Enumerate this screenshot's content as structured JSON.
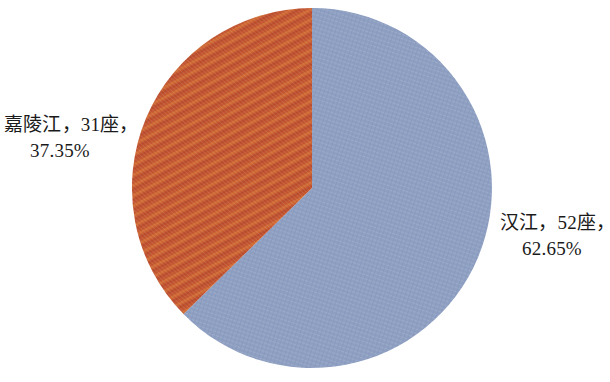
{
  "chart_data": {
    "type": "pie",
    "title": "",
    "subtitle": "",
    "xlabel": "",
    "ylabel": "",
    "grid": false,
    "legend_position": "none",
    "label_format": "{name}，{value}座，{percent}",
    "start_angle_deg": 0,
    "direction": "counterclockwise",
    "total_value": 83,
    "categories": [
      "汉江",
      "嘉陵江"
    ],
    "values": [
      52,
      31
    ],
    "percents": [
      "62.65%",
      "37.35%"
    ],
    "colors": [
      "#8e9fc2",
      "#c2542f"
    ],
    "slices": [
      {
        "name": "汉江",
        "value": 52,
        "unit": "座",
        "percent": "62.65%",
        "percent_value": 62.65,
        "color": "#8e9fc2",
        "label_line_1": "汉江，52座，",
        "label_line_2": "62.65%"
      },
      {
        "name": "嘉陵江",
        "value": 31,
        "unit": "座",
        "percent": "37.35%",
        "percent_value": 37.35,
        "color": "#c2542f",
        "label_line_1": "嘉陵江，31座，",
        "label_line_2": "37.35%"
      }
    ]
  },
  "labels": {
    "jialingjiang": {
      "line_1": "嘉陵江，31座，",
      "line_2": "37.35%"
    },
    "hanjiang": {
      "line_1": "汉江，52座，",
      "line_2": "62.65%"
    }
  },
  "canvas": {
    "background": "#ffffff",
    "text_color": "#1a1a1a"
  }
}
